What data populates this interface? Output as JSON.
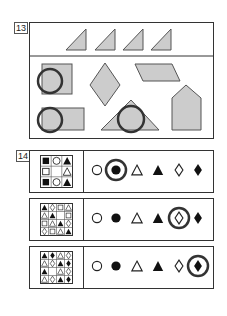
{
  "question13": {
    "label": "13",
    "top_row": [
      "right-triangle",
      "right-triangle",
      "right-triangle",
      "right-triangle"
    ],
    "options": [
      "square-with-circle",
      "diamond",
      "parallelogram",
      "rectangle-with-circle",
      "triangle-with-circle",
      "pentagon"
    ],
    "fill_color": "#cccccc",
    "stroke_color": "#555555"
  },
  "question14": {
    "label": "14",
    "rows": [
      {
        "grid_size": 3,
        "grid": [
          [
            "filled-square",
            "circle",
            "filled-triangle"
          ],
          [
            "square",
            "",
            "triangle"
          ],
          [
            "filled-square",
            "circle",
            "filled-triangle"
          ]
        ],
        "options": [
          "circle",
          "filled-circle",
          "triangle",
          "filled-triangle",
          "diamond",
          "filled-diamond"
        ],
        "circled_index": 1
      },
      {
        "grid_size": 4,
        "grid": [
          [
            "filled-triangle",
            "diamond",
            "square",
            "triangle"
          ],
          [
            "triangle",
            "filled-triangle",
            "",
            "square"
          ],
          [
            "square",
            "triangle",
            "filled-triangle",
            "diamond"
          ],
          [
            "diamond",
            "square",
            "triangle",
            "filled-triangle"
          ]
        ],
        "options": [
          "circle",
          "filled-circle",
          "triangle",
          "filled-triangle",
          "diamond",
          "filled-diamond"
        ],
        "circled_index": 4
      },
      {
        "grid_size": 4,
        "grid": [
          [
            "filled-triangle",
            "filled-diamond",
            "triangle",
            "diamond"
          ],
          [
            "triangle",
            "diamond",
            "filled-triangle",
            "filled-diamond"
          ],
          [
            "filled-triangle",
            "",
            "triangle",
            "diamond"
          ],
          [
            "triangle",
            "diamond",
            "filled-triangle",
            "filled-diamond"
          ]
        ],
        "options": [
          "circle",
          "filled-circle",
          "triangle",
          "filled-triangle",
          "diamond",
          "filled-diamond"
        ],
        "circled_index": 5
      }
    ]
  }
}
